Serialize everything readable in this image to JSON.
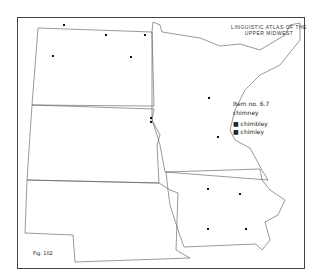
{
  "atlas_title": [
    "LINGUISTIC ATLAS OF THE",
    "UPPER MIDWEST"
  ],
  "legend": {
    "item": "Item no. 6.7",
    "word": "chimney",
    "entries": [
      "chimbley",
      "chimley"
    ]
  },
  "figure": "Fig. 102",
  "points": [
    [
      64,
      25
    ],
    [
      106,
      35
    ],
    [
      145,
      35
    ],
    [
      53,
      56
    ],
    [
      131,
      57
    ],
    [
      151,
      118
    ],
    [
      151,
      122
    ],
    [
      209,
      98
    ],
    [
      218,
      137
    ],
    [
      208,
      189
    ],
    [
      240,
      194
    ],
    [
      208,
      229
    ],
    [
      246,
      229
    ]
  ]
}
